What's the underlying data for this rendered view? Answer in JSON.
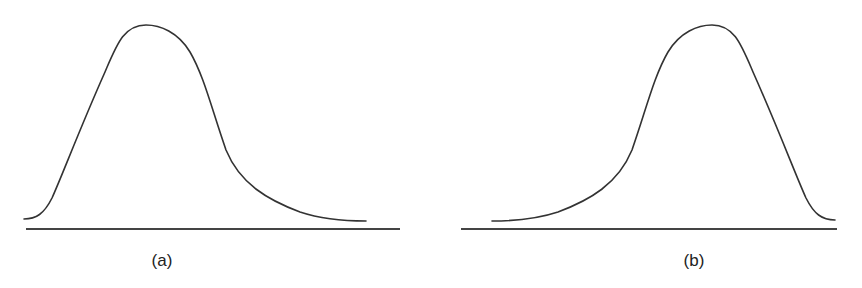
{
  "panels": [
    {
      "label": "(a)",
      "description": "Right-skewed (positively skewed) distribution curve",
      "skew": "right"
    },
    {
      "label": "(b)",
      "description": "Left-skewed (negatively skewed) distribution curve",
      "skew": "left"
    }
  ],
  "colors": {
    "stroke": "#333333",
    "background": "#ffffff"
  }
}
